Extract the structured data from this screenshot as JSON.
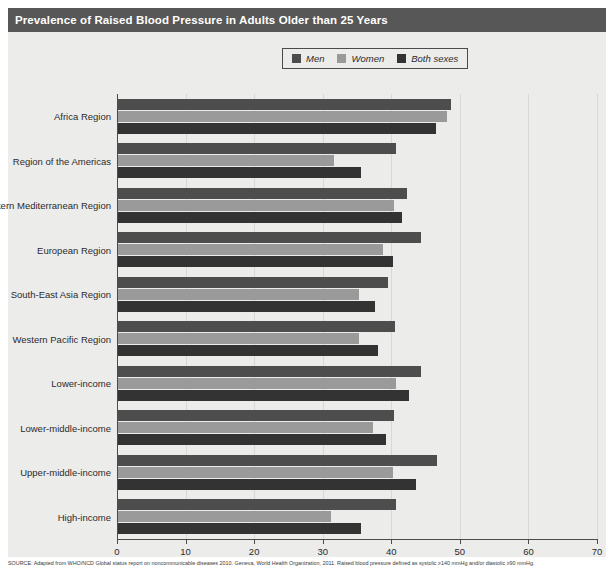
{
  "title": "Prevalence of Raised Blood Pressure in Adults Older than 25 Years",
  "colors": {
    "men": "#4d4d4d",
    "women": "#9a9a9a",
    "both": "#333333",
    "panel_background": "#ececeb",
    "title_background": "#575757",
    "axis": "#4a4a4a",
    "gridline": "#d8d8d7"
  },
  "legend": {
    "position": "top-center",
    "items": [
      {
        "label": "Men",
        "swatch_name": "legend-swatch-men",
        "color": "#4d4d4d"
      },
      {
        "label": "Women",
        "swatch_name": "legend-swatch-women",
        "color": "#9a9a9a"
      },
      {
        "label": "Both sexes",
        "swatch_name": "legend-swatch-both-sexes",
        "color": "#333333"
      }
    ]
  },
  "footnote": "SOURCE: Adapted from WHO/NCD Global status report on noncommunicable diseases 2010. Geneva, World Health Organization, 2011. Raised blood pressure defined as systolic ≥140 mmHg and/or diastolic ≥90 mmHg.",
  "chart_data": {
    "type": "bar",
    "orientation": "horizontal",
    "title": "Prevalence of Raised Blood Pressure in Adults Older than 25 Years",
    "xlabel": "",
    "ylabel": "",
    "xlim": [
      0,
      70
    ],
    "xticks": [
      0,
      10,
      20,
      30,
      40,
      50,
      60,
      70
    ],
    "grid": true,
    "legend_position": "top-center",
    "categories": [
      "Africa Region",
      "Region of the Americas",
      "Eastern Mediterranean Region",
      "European Region",
      "South-East Asia Region",
      "Western Pacific Region",
      "Lower-income",
      "Lower-middle-income",
      "Upper-middle-income",
      "High-income"
    ],
    "series": [
      {
        "name": "Men",
        "color": "#4d4d4d",
        "values": [
          48.6,
          40.6,
          42.2,
          44.2,
          39.4,
          40.4,
          44.2,
          40.3,
          46.5,
          40.5
        ]
      },
      {
        "name": "Women",
        "color": "#9a9a9a",
        "values": [
          48.0,
          31.5,
          40.3,
          38.7,
          35.1,
          35.1,
          40.6,
          37.2,
          40.1,
          31.0
        ]
      },
      {
        "name": "Both sexes",
        "color": "#333333",
        "values": [
          46.4,
          35.4,
          41.4,
          40.1,
          37.5,
          37.9,
          42.4,
          39.1,
          43.5,
          35.4
        ]
      }
    ]
  }
}
